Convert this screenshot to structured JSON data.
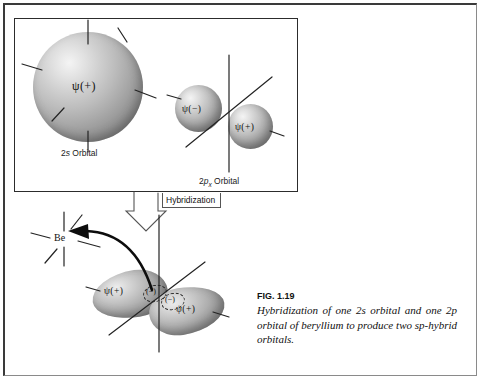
{
  "figure": {
    "id": "FIG. 1.19",
    "caption": "Hybridization of one 2s orbital and one 2p orbital of beryllium to produce two sp-hybrid orbitals."
  },
  "top_box": {
    "s_orbital": {
      "wavefunction_label": "ψ(+)",
      "caption": "2s Orbital",
      "caption_prefix": "2",
      "caption_italic": "s",
      "caption_suffix": " Orbital"
    },
    "p_orbital": {
      "lobe_negative_label": "ψ(−)",
      "lobe_positive_label": "ψ(+)",
      "caption_prefix": "2",
      "caption_italic": "p",
      "caption_subscript": "x",
      "caption_suffix": " Orbital"
    }
  },
  "process": {
    "arrow_label": "Hybridization"
  },
  "hybrid": {
    "left_lobe_label": "ψ(+)",
    "right_lobe_label": "ψ(+)",
    "node_left_sign": "(−)",
    "node_right_sign": "(−)",
    "atom_symbol": "Be"
  },
  "colors": {
    "ink": "#111111",
    "frame": "#2c2c2c",
    "sphere_light": "#f4f4f4",
    "sphere_dark": "#6e6e6e"
  }
}
